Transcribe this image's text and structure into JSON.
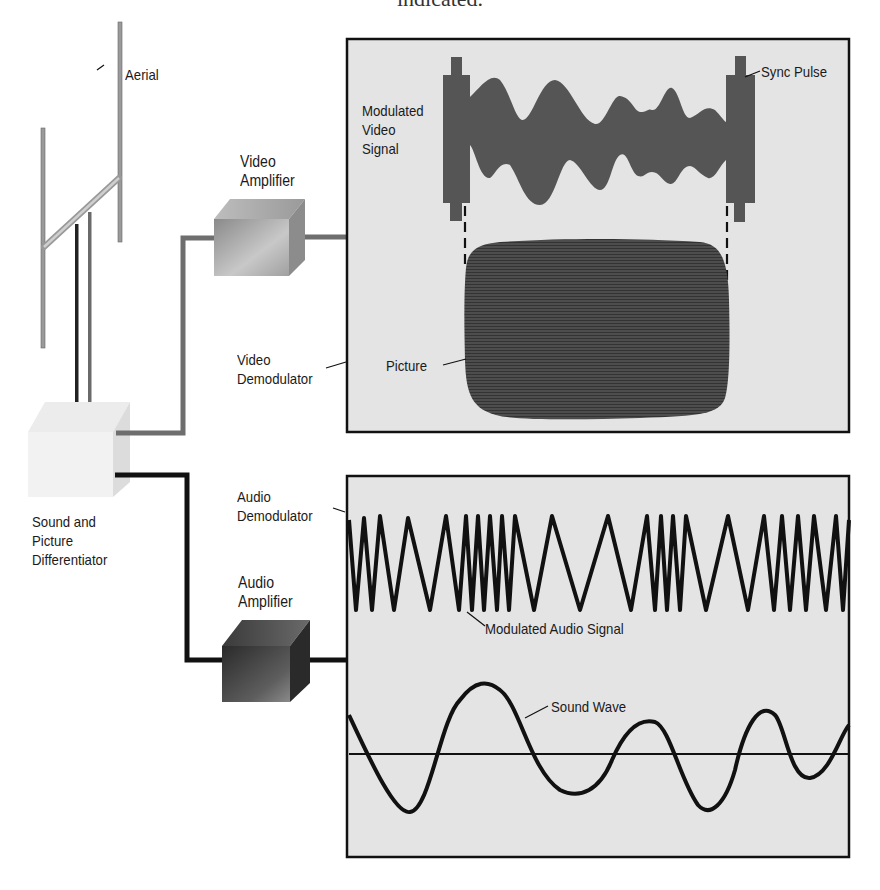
{
  "caption": "indicated.",
  "diagram": {
    "components": {
      "aerial": "Aerial",
      "video_amplifier": [
        "Video",
        "Amplifier"
      ],
      "video_demodulator": [
        "Video",
        "Demodulator"
      ],
      "differentiator": [
        "Sound and",
        "Picture",
        "Differentiator"
      ],
      "audio_amplifier": [
        "Audio",
        "Amplifier"
      ],
      "audio_demodulator": [
        "Audio",
        "Demodulator"
      ]
    },
    "video_panel": {
      "modulated_video_signal": [
        "Modulated",
        "Video",
        "Signal"
      ],
      "sync_pulse": "Sync Pulse",
      "picture": "Picture"
    },
    "audio_panel": {
      "modulated_audio_signal": "Modulated Audio Signal",
      "sound_wave": "Sound Wave"
    },
    "colors": {
      "panel_fill": "#e4e4e4",
      "panel_border": "#111111",
      "signal_fill": "#555555",
      "picture_fill": "#4a4a4a",
      "video_wire": "#6e6e6e",
      "audio_wire": "#111111"
    }
  }
}
